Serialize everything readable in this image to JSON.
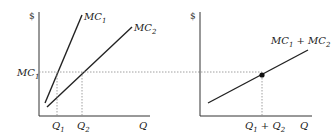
{
  "diagram": {
    "left_panel": {
      "y_axis_label": "$",
      "x_axis_label": "Q",
      "curves": [
        {
          "name": "MC",
          "sub": "1"
        },
        {
          "name": "MC",
          "sub": "2"
        }
      ],
      "level_label": {
        "name": "MC",
        "sub": "1"
      },
      "x_ticks": [
        {
          "name": "Q",
          "sub": "1"
        },
        {
          "name": "Q",
          "sub": "2"
        }
      ]
    },
    "right_panel": {
      "y_axis_label": "$",
      "x_axis_label": "Q",
      "curve_label": {
        "a": "MC",
        "a_sub": "1",
        "plus": " + ",
        "b": "MC",
        "b_sub": "2"
      },
      "x_tick": {
        "a": "Q",
        "a_sub": "1",
        "plus": " + ",
        "b": "Q",
        "b_sub": "2"
      }
    },
    "colors": {
      "line": "#222222",
      "dotted": "#888888"
    }
  }
}
